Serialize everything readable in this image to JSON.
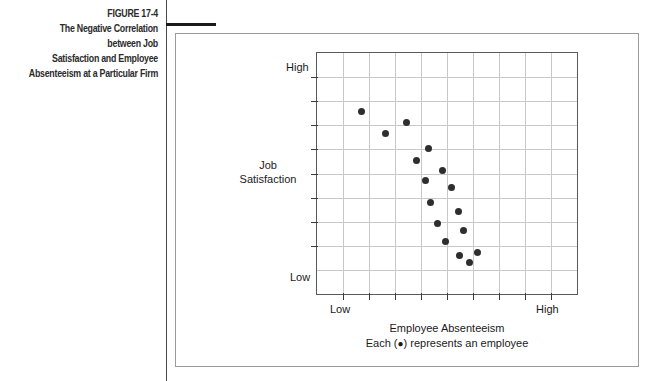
{
  "figure": {
    "number_label": "FIGURE 17-4",
    "title_lines": [
      "The Negative Correlation between Job",
      "Satisfaction and Employee",
      "Absenteeism at a Particular Firm"
    ]
  },
  "legend": {
    "prefix": "Each (",
    "bullet": "●",
    "suffix": ") represents an employee"
  },
  "chart_data": {
    "type": "scatter",
    "title": "The Negative Correlation between Job Satisfaction and Employee Absenteeism at a Particular Firm",
    "xlabel": "Employee Absenteeism",
    "ylabel": "Job Satisfaction",
    "x_tick_labels": [
      "Low",
      "High"
    ],
    "y_tick_labels": [
      "High",
      "Low"
    ],
    "x_low_label": "Low",
    "x_high_label": "High",
    "y_high_label": "High",
    "y_low_label": "Low",
    "xlim": [
      0,
      10
    ],
    "ylim": [
      0,
      10
    ],
    "grid": true,
    "legend_position": "below-plot",
    "x_gridline_count": 9,
    "y_gridline_count": 9,
    "x_tick_count": 9,
    "y_tick_count": 8,
    "points": [
      {
        "x": 1.72,
        "y": 7.58
      },
      {
        "x": 3.43,
        "y": 7.1
      },
      {
        "x": 2.63,
        "y": 6.68
      },
      {
        "x": 4.28,
        "y": 6.03
      },
      {
        "x": 3.82,
        "y": 5.56
      },
      {
        "x": 4.82,
        "y": 5.13
      },
      {
        "x": 4.18,
        "y": 4.73
      },
      {
        "x": 5.18,
        "y": 4.42
      },
      {
        "x": 4.38,
        "y": 3.78
      },
      {
        "x": 5.45,
        "y": 3.42
      },
      {
        "x": 4.65,
        "y": 2.94
      },
      {
        "x": 5.63,
        "y": 2.64
      },
      {
        "x": 4.95,
        "y": 2.17
      },
      {
        "x": 5.48,
        "y": 1.62
      },
      {
        "x": 6.18,
        "y": 1.72
      },
      {
        "x": 5.88,
        "y": 1.32
      }
    ]
  }
}
